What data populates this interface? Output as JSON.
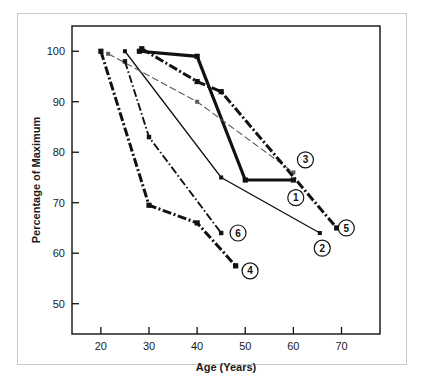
{
  "chart_data": {
    "type": "line",
    "title": "",
    "xlabel": "Age (Years)",
    "ylabel": "Percentage of Maximum",
    "xlim": [
      14,
      78
    ],
    "ylim": [
      44,
      105
    ],
    "xticks": [
      20,
      30,
      40,
      50,
      60,
      70
    ],
    "yticks": [
      50,
      60,
      70,
      80,
      90,
      100
    ],
    "grid": false,
    "legend": "inline-circled-numbers",
    "series": [
      {
        "name": "1",
        "label": "1",
        "style": "thick-solid",
        "color": "#111111",
        "label_x": 60.5,
        "label_y": 71.0,
        "x": [
          28,
          40,
          50,
          60
        ],
        "y": [
          100,
          99,
          74.5,
          74.5
        ]
      },
      {
        "name": "2",
        "label": "2",
        "style": "thin-solid",
        "color": "#111111",
        "label_x": 66.0,
        "label_y": 61.0,
        "x": [
          25,
          45,
          65.5
        ],
        "y": [
          100,
          75,
          64
        ]
      },
      {
        "name": "3",
        "label": "3",
        "style": "thin-dashed",
        "color": "#5a5a5a",
        "label_x": 62.5,
        "label_y": 78.5,
        "x": [
          21.5,
          40,
          60
        ],
        "y": [
          99.5,
          90,
          76
        ]
      },
      {
        "name": "4",
        "label": "4",
        "style": "thick-dashdot",
        "color": "#111111",
        "label_x": 51.0,
        "label_y": 56.5,
        "x": [
          20,
          30,
          40,
          48
        ],
        "y": [
          100,
          69.5,
          66,
          57.5
        ]
      },
      {
        "name": "5",
        "label": "5",
        "style": "thick-dashdot",
        "color": "#111111",
        "label_x": 71.0,
        "label_y": 65.0,
        "x": [
          28.5,
          40,
          45,
          69
        ],
        "y": [
          100.5,
          94,
          92,
          65
        ]
      },
      {
        "name": "6",
        "label": "6",
        "style": "thin-dashdot",
        "color": "#111111",
        "label_x": 48.5,
        "label_y": 64.0,
        "x": [
          25,
          30,
          45
        ],
        "y": [
          98,
          83,
          64
        ]
      }
    ]
  },
  "caption": {
    "text": ""
  }
}
